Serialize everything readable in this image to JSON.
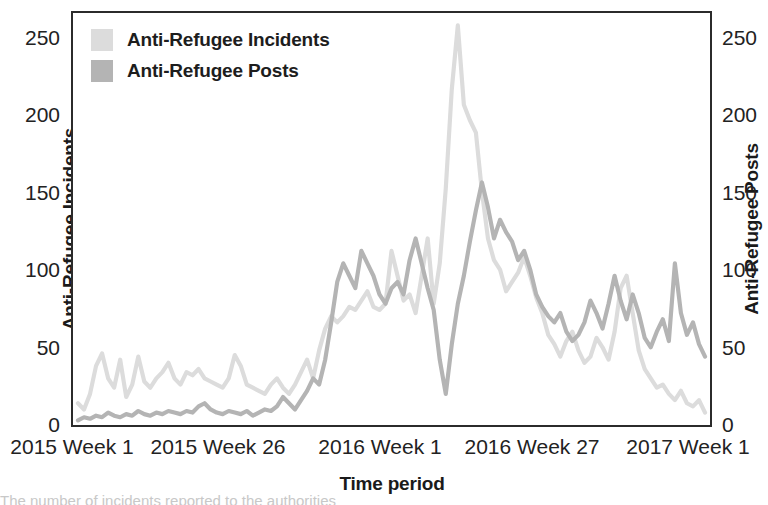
{
  "figure": {
    "background": "#ffffff",
    "frame_color": "#2b2b2b",
    "bottom_partial_text": "The number of incidents reported to the authorities"
  },
  "legend": {
    "position": "top-left-inside",
    "entries": [
      {
        "label": "Anti-Refugee Incidents",
        "color": "#dcdcdc",
        "swatch": "legend-swatch-incidents"
      },
      {
        "label": "Anti-Refugee Posts",
        "color": "#b4b4b4",
        "swatch": "legend-swatch-posts"
      }
    ]
  },
  "axes": {
    "left": {
      "title": "Anti-Refugee Incidents",
      "ticks": [
        "0",
        "50",
        "100",
        "150",
        "200",
        "250"
      ]
    },
    "right": {
      "title": "Anti-Refugee Posts",
      "ticks": [
        "0",
        "50",
        "100",
        "150",
        "200",
        "250"
      ]
    },
    "bottom": {
      "title": "Time period",
      "ticks": [
        "2015 Week 1",
        "2015 Week 26",
        "2016 Week 1",
        "2016 Week 27",
        "2017 Week 1"
      ]
    }
  },
  "chart_data": {
    "type": "line",
    "title": "",
    "xlabel": "Time period",
    "ylabel": "Anti-Refugee Incidents",
    "y2label": "Anti-Refugee Posts",
    "ylim": [
      0,
      265
    ],
    "y2lim": [
      0,
      265
    ],
    "yticks": [
      0,
      50,
      100,
      150,
      200,
      250
    ],
    "y2ticks": [
      0,
      50,
      100,
      150,
      200,
      250
    ],
    "grid": false,
    "legend_position": "upper left",
    "x_tick_labels": [
      "2015 Week 1",
      "2015 Week 26",
      "2016 Week 1",
      "2016 Week 27",
      "2017 Week 1"
    ],
    "x_tick_indices": [
      0,
      25,
      52,
      78,
      104
    ],
    "x": "weekly index from 2015 Week 1 through 2017 Week 1 (105 weeks)",
    "series": [
      {
        "name": "Anti-Refugee Incidents",
        "color": "#dcdcdc",
        "axis": "left",
        "values": [
          14,
          10,
          20,
          38,
          46,
          30,
          24,
          42,
          18,
          26,
          44,
          28,
          24,
          30,
          34,
          40,
          30,
          26,
          34,
          32,
          36,
          30,
          28,
          26,
          24,
          30,
          45,
          38,
          26,
          24,
          22,
          20,
          26,
          30,
          24,
          20,
          26,
          34,
          42,
          30,
          48,
          62,
          70,
          66,
          70,
          76,
          74,
          80,
          86,
          76,
          74,
          78,
          112,
          96,
          80,
          84,
          72,
          96,
          120,
          78,
          104,
          152,
          216,
          257,
          206,
          196,
          188,
          150,
          120,
          106,
          100,
          86,
          92,
          98,
          108,
          96,
          82,
          72,
          58,
          52,
          44,
          54,
          60,
          48,
          40,
          44,
          56,
          50,
          42,
          60,
          88,
          96,
          72,
          48,
          36,
          30,
          24,
          26,
          20,
          16,
          22,
          14,
          12,
          16,
          8
        ]
      },
      {
        "name": "Anti-Refugee Posts",
        "color": "#b4b4b4",
        "axis": "right",
        "values": [
          3,
          5,
          4,
          6,
          5,
          8,
          6,
          5,
          7,
          6,
          9,
          7,
          6,
          8,
          7,
          9,
          8,
          7,
          9,
          8,
          12,
          14,
          10,
          8,
          7,
          9,
          8,
          7,
          9,
          6,
          8,
          10,
          9,
          12,
          18,
          14,
          10,
          16,
          22,
          30,
          26,
          42,
          66,
          92,
          104,
          96,
          88,
          112,
          104,
          96,
          84,
          78,
          88,
          92,
          84,
          106,
          120,
          104,
          88,
          74,
          42,
          20,
          52,
          78,
          96,
          118,
          138,
          156,
          140,
          120,
          132,
          124,
          118,
          106,
          112,
          100,
          84,
          76,
          70,
          66,
          72,
          60,
          54,
          58,
          66,
          80,
          72,
          62,
          78,
          96,
          80,
          68,
          84,
          72,
          56,
          50,
          60,
          68,
          54,
          104,
          72,
          58,
          66,
          52,
          44
        ]
      }
    ]
  }
}
